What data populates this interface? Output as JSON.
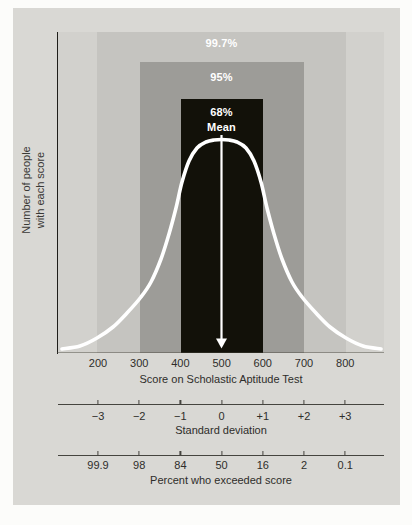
{
  "figure": {
    "y_axis_label": {
      "line1": "Number of people",
      "line2": "with each score"
    },
    "band_labels": {
      "p997": "99.7%",
      "p95": "95%",
      "p68": "68%"
    },
    "mean_label": "Mean"
  },
  "axes": {
    "sat": {
      "tick_labels": [
        "200",
        "300",
        "400",
        "500",
        "600",
        "700",
        "800"
      ],
      "title": "Score on Scholastic Aptitude Test"
    },
    "sd": {
      "tick_labels": [
        "−3",
        "−2",
        "−1",
        "0",
        "+1",
        "+2",
        "+3"
      ],
      "title": "Standard deviation"
    },
    "percent": {
      "tick_labels": [
        "99.9",
        "98",
        "84",
        "50",
        "16",
        "2",
        "0.1"
      ],
      "title": "Percent who exceeded score"
    }
  },
  "colors": {
    "page_bg": "#fcfcfa",
    "panel_bg": "#d9d8d4",
    "plot_bg": "#d2d1cd",
    "band_99_7": "#c5c4c0",
    "band_95": "#9d9c98",
    "band_68": "#121109",
    "curve": "#ffffff",
    "axis_text": "#2e2d2a",
    "axis_line": "#45443f"
  },
  "chart_data": {
    "type": "area",
    "xlabel": "Score on Scholastic Aptitude Test",
    "ylabel": "Number of people with each score",
    "mean": 500,
    "standard_deviation": 100,
    "x_axis_sat_ticks": [
      200,
      300,
      400,
      500,
      600,
      700,
      800
    ],
    "x_axis_sd_ticks": [
      -3,
      -2,
      -1,
      0,
      1,
      2,
      3
    ],
    "percent_who_exceeded": [
      99.9,
      98,
      84,
      50,
      16,
      2,
      0.1
    ],
    "bands": [
      {
        "label": "68%",
        "sat_range": [
          400,
          600
        ],
        "sd_range": [
          -1,
          1
        ]
      },
      {
        "label": "95%",
        "sat_range": [
          300,
          700
        ],
        "sd_range": [
          -2,
          2
        ]
      },
      {
        "label": "99.7%",
        "sat_range": [
          200,
          800
        ],
        "sd_range": [
          -3,
          3
        ]
      }
    ],
    "grid": false,
    "legend": "none"
  },
  "render_geometry": {
    "tick_x_start": 98,
    "tick_x_step": 41.2,
    "curve_points": [
      [
        62,
        349
      ],
      [
        80,
        346
      ],
      [
        97,
        338
      ],
      [
        113,
        327
      ],
      [
        127,
        313
      ],
      [
        141,
        297
      ],
      [
        151,
        282
      ],
      [
        161,
        259
      ],
      [
        169,
        234
      ],
      [
        176,
        208
      ],
      [
        182,
        182
      ],
      [
        189,
        161
      ],
      [
        197,
        148
      ],
      [
        206,
        142
      ],
      [
        214,
        140
      ],
      [
        221.5,
        139.5
      ],
      [
        229,
        140
      ],
      [
        237,
        142
      ],
      [
        246,
        148
      ],
      [
        254,
        161
      ],
      [
        261,
        182
      ],
      [
        267,
        208
      ],
      [
        274,
        234
      ],
      [
        282,
        259
      ],
      [
        292,
        282
      ],
      [
        302,
        297
      ],
      [
        316,
        313
      ],
      [
        330,
        327
      ],
      [
        346,
        338
      ],
      [
        363,
        346
      ],
      [
        381,
        349
      ]
    ]
  }
}
